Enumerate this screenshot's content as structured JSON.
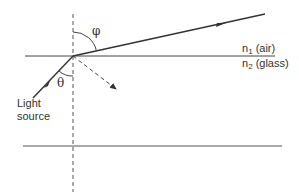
{
  "diagram": {
    "type": "refraction-at-interface",
    "labels": {
      "phi": "φ",
      "theta": "θ",
      "medium_top_n": "n",
      "medium_top_sub": "1",
      "medium_top_name": " (air)",
      "medium_bottom_n": "n",
      "medium_bottom_sub": "2",
      "medium_bottom_name": " (glass)",
      "source_line1": "Light",
      "source_line2": "source"
    },
    "colors": {
      "stroke": "#333333",
      "background": "#ffffff"
    }
  }
}
